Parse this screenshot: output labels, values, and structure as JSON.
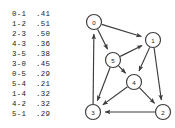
{
  "edge_list": {
    "name": "edge-weighted-digraph-edge-list",
    "rows": [
      {
        "pair": "0-1",
        "weight": ".41"
      },
      {
        "pair": "1-2",
        "weight": ".51"
      },
      {
        "pair": "2-3",
        "weight": ".50"
      },
      {
        "pair": "4-3",
        "weight": ".36"
      },
      {
        "pair": "3-5",
        "weight": ".38"
      },
      {
        "pair": "3-0",
        "weight": ".45"
      },
      {
        "pair": "0-5",
        "weight": ".29"
      },
      {
        "pair": "5-4",
        "weight": ".21"
      },
      {
        "pair": "1-4",
        "weight": ".32"
      },
      {
        "pair": "4-2",
        "weight": ".32"
      },
      {
        "pair": "5-1",
        "weight": ".29"
      }
    ]
  },
  "graph": {
    "nodes": [
      {
        "id": "0",
        "x": 18,
        "y": 22,
        "r": 7.5
      },
      {
        "id": "1",
        "x": 77,
        "y": 40,
        "r": 7.5
      },
      {
        "id": "2",
        "x": 87,
        "y": 112,
        "r": 7.5
      },
      {
        "id": "3",
        "x": 17,
        "y": 112,
        "r": 7.5
      },
      {
        "id": "4",
        "x": 58,
        "y": 82,
        "r": 7.5
      },
      {
        "id": "5",
        "x": 37,
        "y": 60,
        "r": 7.5
      }
    ],
    "directed_edges": [
      {
        "from": "0",
        "to": "1"
      },
      {
        "from": "0",
        "to": "5"
      },
      {
        "from": "1",
        "to": "2"
      },
      {
        "from": "1",
        "to": "4"
      },
      {
        "from": "2",
        "to": "3"
      },
      {
        "from": "3",
        "to": "0"
      },
      {
        "from": "4",
        "to": "2"
      },
      {
        "from": "4",
        "to": "3"
      },
      {
        "from": "5",
        "to": "1"
      },
      {
        "from": "5",
        "to": "3"
      },
      {
        "from": "5",
        "to": "4"
      }
    ]
  },
  "colors": {
    "background": "#ffffff",
    "stroke": "#3b3b3b",
    "text": "#1a1a1a"
  }
}
